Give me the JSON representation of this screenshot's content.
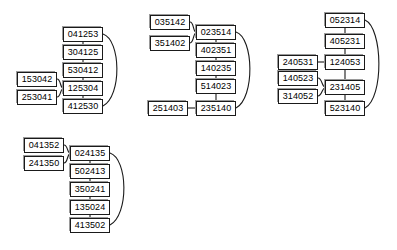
{
  "diagram": {
    "node_count": 27,
    "group_count": 4,
    "colors": {
      "node_fill": "#ffffff",
      "node_border": "#1a1a1a",
      "node_shadow": "#9a9a9a",
      "edge": "#1a1a1a",
      "background": "#ffffff"
    },
    "groups": [
      {
        "id": "group-1",
        "chain": [
          "041253",
          "304125",
          "530412",
          "125304",
          "412530"
        ],
        "inputs": [
          "153042",
          "253041"
        ],
        "input_target": "125304",
        "loop_from": "041253",
        "loop_to": "412530"
      },
      {
        "id": "group-2",
        "chain": [
          "023514",
          "402351",
          "140235",
          "514023",
          "235140"
        ],
        "inputs": [
          "035142",
          "351402"
        ],
        "input_target": "023514",
        "extra_inputs": [
          {
            "label": "251403",
            "target": "235140"
          }
        ],
        "loop_from": "023514",
        "loop_to": "235140"
      },
      {
        "id": "group-3",
        "chain": [
          "052314",
          "405231",
          "124053",
          "231405",
          "523140"
        ],
        "inputs": [
          "140523",
          "314052"
        ],
        "input_target": "231405",
        "extra_inputs": [
          {
            "label": "240531",
            "target": "124053"
          }
        ],
        "loop_from": "052314",
        "loop_to": "523140"
      },
      {
        "id": "group-4",
        "chain": [
          "024135",
          "502413",
          "350241",
          "135024",
          "413502"
        ],
        "inputs": [
          "041352",
          "241350"
        ],
        "input_target": "024135",
        "loop_from": "024135",
        "loop_to": "413502"
      }
    ],
    "nodes": [
      {
        "name": "g1-chain-0",
        "label": "041253",
        "x": 63,
        "y": 27
      },
      {
        "name": "g1-chain-1",
        "label": "304125",
        "x": 63,
        "y": 45
      },
      {
        "name": "g1-chain-2",
        "label": "530412",
        "x": 63,
        "y": 63
      },
      {
        "name": "g1-chain-3",
        "label": "125304",
        "x": 63,
        "y": 81
      },
      {
        "name": "g1-chain-4",
        "label": "412530",
        "x": 63,
        "y": 99
      },
      {
        "name": "g1-input-0",
        "label": "153042",
        "x": 17,
        "y": 72
      },
      {
        "name": "g1-input-1",
        "label": "253041",
        "x": 17,
        "y": 90
      },
      {
        "name": "g2-chain-0",
        "label": "023514",
        "x": 196,
        "y": 25
      },
      {
        "name": "g2-chain-1",
        "label": "402351",
        "x": 196,
        "y": 43
      },
      {
        "name": "g2-chain-2",
        "label": "140235",
        "x": 196,
        "y": 61
      },
      {
        "name": "g2-chain-3",
        "label": "514023",
        "x": 196,
        "y": 79
      },
      {
        "name": "g2-chain-4",
        "label": "235140",
        "x": 196,
        "y": 101
      },
      {
        "name": "g2-input-0",
        "label": "035142",
        "x": 150,
        "y": 15
      },
      {
        "name": "g2-input-1",
        "label": "351402",
        "x": 150,
        "y": 36
      },
      {
        "name": "g2-input-2",
        "label": "251403",
        "x": 148,
        "y": 101
      },
      {
        "name": "g3-chain-0",
        "label": "052314",
        "x": 325,
        "y": 13
      },
      {
        "name": "g3-chain-1",
        "label": "405231",
        "x": 325,
        "y": 34
      },
      {
        "name": "g3-chain-2",
        "label": "124053",
        "x": 325,
        "y": 55
      },
      {
        "name": "g3-chain-3",
        "label": "231405",
        "x": 325,
        "y": 80
      },
      {
        "name": "g3-chain-4",
        "label": "523140",
        "x": 325,
        "y": 101
      },
      {
        "name": "g3-input-0",
        "label": "240531",
        "x": 278,
        "y": 55
      },
      {
        "name": "g3-input-1",
        "label": "140523",
        "x": 278,
        "y": 71
      },
      {
        "name": "g3-input-2",
        "label": "314052",
        "x": 278,
        "y": 89
      },
      {
        "name": "g4-chain-0",
        "label": "024135",
        "x": 70,
        "y": 146
      },
      {
        "name": "g4-chain-1",
        "label": "502413",
        "x": 70,
        "y": 164
      },
      {
        "name": "g4-chain-2",
        "label": "350241",
        "x": 70,
        "y": 182
      },
      {
        "name": "g4-chain-3",
        "label": "135024",
        "x": 70,
        "y": 200
      },
      {
        "name": "g4-chain-4",
        "label": "413502",
        "x": 70,
        "y": 218
      },
      {
        "name": "g4-input-0",
        "label": "041352",
        "x": 24,
        "y": 138
      },
      {
        "name": "g4-input-1",
        "label": "241350",
        "x": 24,
        "y": 156
      }
    ],
    "edges": [
      {
        "name": "g1-edge-0-1",
        "type": "line",
        "d": "M83,42 L83,45"
      },
      {
        "name": "g1-edge-1-2",
        "type": "line",
        "d": "M83,60 L83,63"
      },
      {
        "name": "g1-edge-2-3",
        "type": "line",
        "d": "M83,78 L83,81"
      },
      {
        "name": "g1-edge-3-4",
        "type": "line",
        "d": "M83,96 L83,99"
      },
      {
        "name": "g1-edge-in0",
        "type": "curve",
        "d": "M57,79 C61,79 60,88 63,88"
      },
      {
        "name": "g1-edge-in1",
        "type": "curve",
        "d": "M57,97 C61,97 60,89 63,89"
      },
      {
        "name": "g1-edge-loop",
        "type": "curve",
        "d": "M103,34 C121,40 122,96 103,106"
      },
      {
        "name": "g2-edge-0-1",
        "type": "line",
        "d": "M216,40 L216,43"
      },
      {
        "name": "g2-edge-1-2",
        "type": "line",
        "d": "M216,58 L216,61"
      },
      {
        "name": "g2-edge-2-3",
        "type": "line",
        "d": "M216,76 L216,79"
      },
      {
        "name": "g2-edge-3-4",
        "type": "line",
        "d": "M216,94 L216,101"
      },
      {
        "name": "g2-edge-in0",
        "type": "curve",
        "d": "M190,22 C194,22 193,32 196,32"
      },
      {
        "name": "g2-edge-in1",
        "type": "curve",
        "d": "M190,43 C194,43 193,33 196,33"
      },
      {
        "name": "g2-edge-in2",
        "type": "line",
        "d": "M188,108 L196,108"
      },
      {
        "name": "g2-edge-loop",
        "type": "curve",
        "d": "M236,32 C254,38 255,98 236,108"
      },
      {
        "name": "g3-edge-0-1",
        "type": "line",
        "d": "M345,28 L345,34"
      },
      {
        "name": "g3-edge-1-2",
        "type": "line",
        "d": "M345,49 L345,55"
      },
      {
        "name": "g3-edge-2-3",
        "type": "line",
        "d": "M345,70 L345,80"
      },
      {
        "name": "g3-edge-3-4",
        "type": "line",
        "d": "M345,95 L345,101"
      },
      {
        "name": "g3-edge-in0",
        "type": "line",
        "d": "M318,62 L325,62"
      },
      {
        "name": "g3-edge-in1",
        "type": "curve",
        "d": "M318,78 C322,78 322,87 325,87"
      },
      {
        "name": "g3-edge-in2",
        "type": "curve",
        "d": "M318,96 C322,96 322,88 325,88"
      },
      {
        "name": "g3-edge-loop",
        "type": "curve",
        "d": "M365,20 C383,28 384,98 365,108"
      },
      {
        "name": "g4-edge-0-1",
        "type": "line",
        "d": "M90,161 L90,164"
      },
      {
        "name": "g4-edge-1-2",
        "type": "line",
        "d": "M90,179 L90,182"
      },
      {
        "name": "g4-edge-2-3",
        "type": "line",
        "d": "M90,197 L90,200"
      },
      {
        "name": "g4-edge-3-4",
        "type": "line",
        "d": "M90,215 L90,218"
      },
      {
        "name": "g4-edge-in0",
        "type": "curve",
        "d": "M64,145 C68,145 67,153 70,153"
      },
      {
        "name": "g4-edge-in1",
        "type": "curve",
        "d": "M64,163 C68,163 67,154 70,154"
      },
      {
        "name": "g4-edge-loop",
        "type": "curve",
        "d": "M110,153 C128,159 129,215 110,225"
      }
    ]
  }
}
